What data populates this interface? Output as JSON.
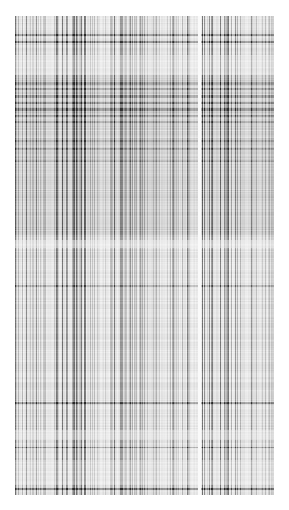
{
  "image": {
    "description": "grayscale line-matrix texture",
    "canvas": {
      "width": 289,
      "height": 510,
      "background": "#ffffff"
    },
    "region": {
      "x": 15,
      "y": 16,
      "width": 259,
      "height": 479
    },
    "base_gray": 205,
    "vertical_gap": {
      "x": 198,
      "width": 3,
      "color": "#ffffff"
    },
    "dark_rows": [
      {
        "y": 34,
        "h": 2,
        "strength": 0.55
      },
      {
        "y": 41,
        "h": 2,
        "strength": 0.6
      },
      {
        "y": 82,
        "h": 3,
        "strength": 0.35
      },
      {
        "y": 88,
        "h": 2,
        "strength": 0.35
      },
      {
        "y": 95,
        "h": 3,
        "strength": 0.4
      },
      {
        "y": 102,
        "h": 2,
        "strength": 0.45
      },
      {
        "y": 108,
        "h": 3,
        "strength": 0.5
      },
      {
        "y": 115,
        "h": 2,
        "strength": 0.4
      },
      {
        "y": 121,
        "h": 2,
        "strength": 0.35
      },
      {
        "y": 140,
        "h": 2,
        "strength": 0.3
      },
      {
        "y": 148,
        "h": 2,
        "strength": 0.3
      },
      {
        "y": 160,
        "h": 2,
        "strength": 0.25
      },
      {
        "y": 285,
        "h": 2,
        "strength": 0.3
      },
      {
        "y": 402,
        "h": 2,
        "strength": 0.6
      },
      {
        "y": 447,
        "h": 1,
        "strength": 0.55
      },
      {
        "y": 488,
        "h": 2,
        "strength": 0.7
      }
    ],
    "light_rows": [
      {
        "y": 55,
        "h": 20,
        "strength": 0.35
      },
      {
        "y": 240,
        "h": 8,
        "strength": 0.5
      },
      {
        "y": 430,
        "h": 10,
        "strength": 0.4
      },
      {
        "y": 460,
        "h": 25,
        "strength": 0.3
      }
    ],
    "seed": 7
  }
}
